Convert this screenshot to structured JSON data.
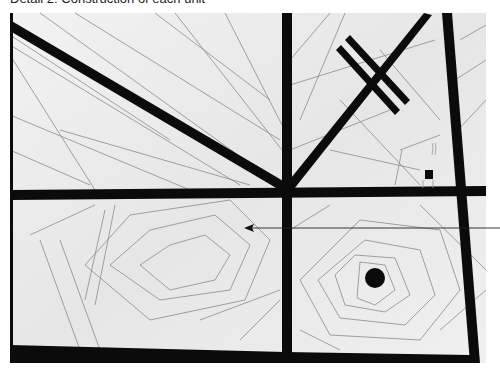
{
  "caption": "Detail 2: Construction of each unit",
  "figure": {
    "colors": {
      "fabric": "#eeeeee",
      "band": "#0a0a0a",
      "stitch": "#777777",
      "background": "#ffffff"
    },
    "annotation": "arrow-pointer"
  }
}
